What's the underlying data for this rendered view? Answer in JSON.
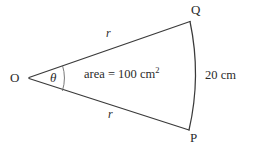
{
  "figure": {
    "type": "geometry-diagram",
    "background_color": "#ffffff",
    "stroke_color": "#3a3a3a",
    "text_color": "#2b2b2b",
    "labels": {
      "center_point": "O",
      "arc_end_top": "Q",
      "arc_end_bottom": "P",
      "radius_top": "r",
      "radius_bottom": "r",
      "angle": "θ",
      "area_text": "area = 100 cm",
      "area_exponent": "2",
      "chord_text": "20 cm"
    },
    "values": {
      "area": 100,
      "area_units": "cm^2",
      "chord_length": 20,
      "chord_units": "cm",
      "radius_symbol": "r",
      "angle_symbol": "θ"
    },
    "geometry": {
      "vertex": [
        28,
        78
      ],
      "point_Q": [
        190,
        21
      ],
      "point_P": [
        189,
        130
      ],
      "arc_bulge_x": 199,
      "angle_arc_x": 64
    }
  }
}
